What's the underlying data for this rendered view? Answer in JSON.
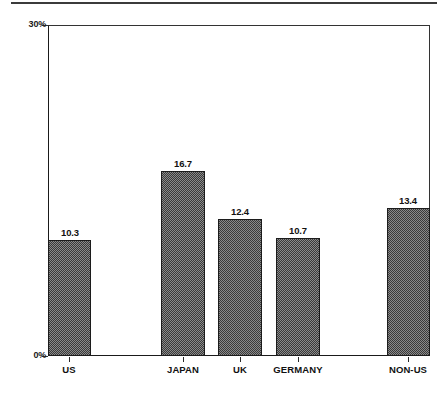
{
  "chart_data": {
    "type": "bar",
    "title": "",
    "subtitle": "",
    "xlabel": "",
    "ylabel": "",
    "categories": [
      "US",
      "JAPAN",
      "UK",
      "GERMANY",
      "NON-US"
    ],
    "values": [
      10.3,
      16.7,
      12.4,
      10.7,
      13.4
    ],
    "value_labels": [
      "10.3",
      "16.7",
      "12.4",
      "10.7",
      "13.4"
    ],
    "ylim": [
      0,
      30
    ],
    "ytick_values": [
      0,
      30
    ],
    "ytick_labels": [
      "0%",
      "30%"
    ],
    "grid": false,
    "legend": null,
    "legend_position": "none",
    "annotations": [],
    "bar_fill": "#8a8a8a",
    "bar_pattern": "checkerboard-dither",
    "bar_outline": "#1c1c1c",
    "axis_color": "#1a1a1a",
    "background": "#ffffff",
    "bar_geometry": [
      {
        "category": "US",
        "left": 48,
        "width": 43,
        "top": 240,
        "tick_x": 69,
        "label_left": 40,
        "label_width": 60
      },
      {
        "category": "JAPAN",
        "left": 161,
        "width": 44,
        "top": 171,
        "tick_x": 183,
        "label_left": 153,
        "label_width": 60
      },
      {
        "category": "UK",
        "left": 218,
        "width": 44,
        "top": 219,
        "tick_x": 240,
        "label_left": 210,
        "label_width": 60
      },
      {
        "category": "GERMANY",
        "left": 276,
        "width": 44,
        "top": 238,
        "tick_x": 298,
        "label_left": 268,
        "label_width": 60
      },
      {
        "category": "NON-US",
        "left": 387,
        "width": 43,
        "top": 208,
        "tick_x": 408,
        "label_left": 378,
        "label_width": 60
      }
    ]
  },
  "icons": {
    "top_rule": "horizontal-rule-divider"
  }
}
